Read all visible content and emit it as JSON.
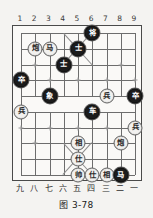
{
  "figure": {
    "caption": "图 3-78",
    "board": {
      "files": 9,
      "ranks": 10,
      "top_labels": [
        "1",
        "2",
        "3",
        "4",
        "5",
        "6",
        "7",
        "8",
        "9"
      ],
      "bottom_labels": [
        "九",
        "八",
        "七",
        "六",
        "五",
        "四",
        "三",
        "二",
        "一"
      ],
      "board_color": "#faf9f7",
      "line_color": "#6d6d6d",
      "border_color": "#4a4a4a",
      "page_background": "#f4f3f1",
      "red_piece_fill": "#f2f1ef",
      "red_piece_text": "#2b2b2b",
      "black_piece_fill": "#1b1b1b",
      "black_piece_text": "#ffffff"
    },
    "pieces": [
      {
        "id": "p01",
        "label": "将",
        "side": "black",
        "col": 6,
        "row": 0
      },
      {
        "id": "p02",
        "label": "炮",
        "side": "red",
        "col": 2,
        "row": 1
      },
      {
        "id": "p03",
        "label": "马",
        "side": "red",
        "col": 3,
        "row": 1
      },
      {
        "id": "p04",
        "label": "士",
        "side": "black",
        "col": 5,
        "row": 1
      },
      {
        "id": "p05",
        "label": "士",
        "side": "black",
        "col": 4,
        "row": 2
      },
      {
        "id": "p06",
        "label": "卒",
        "side": "black",
        "col": 1,
        "row": 3
      },
      {
        "id": "p07",
        "label": "象",
        "side": "black",
        "col": 3,
        "row": 4
      },
      {
        "id": "p08",
        "label": "兵",
        "side": "red",
        "col": 7,
        "row": 4
      },
      {
        "id": "p09",
        "label": "卒",
        "side": "black",
        "col": 9,
        "row": 4
      },
      {
        "id": "p10",
        "label": "兵",
        "side": "red",
        "col": 1,
        "row": 5
      },
      {
        "id": "p11",
        "label": "车",
        "side": "black",
        "col": 6,
        "row": 5
      },
      {
        "id": "p12",
        "label": "兵",
        "side": "red",
        "col": 9,
        "row": 6
      },
      {
        "id": "p13",
        "label": "相",
        "side": "red",
        "col": 5,
        "row": 7
      },
      {
        "id": "p14",
        "label": "炮",
        "side": "red",
        "col": 8,
        "row": 7
      },
      {
        "id": "p15",
        "label": "仕",
        "side": "red",
        "col": 5,
        "row": 8
      },
      {
        "id": "p16",
        "label": "帅",
        "side": "red",
        "col": 5,
        "row": 9
      },
      {
        "id": "p17",
        "label": "仕",
        "side": "red",
        "col": 6,
        "row": 9
      },
      {
        "id": "p18",
        "label": "相",
        "side": "red",
        "col": 7,
        "row": 9
      },
      {
        "id": "p19",
        "label": "马",
        "side": "black",
        "col": 8,
        "row": 9
      }
    ]
  }
}
